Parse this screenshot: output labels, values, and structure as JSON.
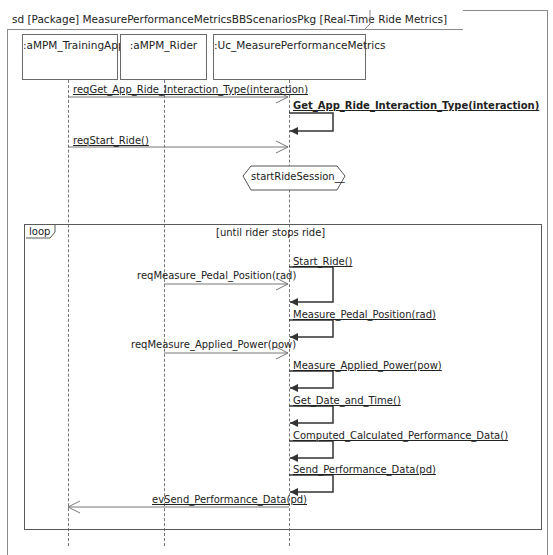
{
  "frame": {
    "title": "sd [Package] MeasurePerformanceMetricsBBScenariosPkg [Real-Time Ride Metrics]"
  },
  "lifelines": [
    {
      "label": ":aMPM_TrainingApp"
    },
    {
      "label": ":aMPM_Rider"
    },
    {
      "label": ":Uc_MeasurePerformanceMetrics"
    }
  ],
  "messages": [
    {
      "label": "reqGet_App_Ride_Interaction_Type(interaction)",
      "from": ":aMPM_TrainingApp",
      "to": ":Uc_MeasurePerformanceMetrics",
      "kind": "async"
    },
    {
      "label": "Get_App_Ride_Interaction_Type(interaction)",
      "from": ":Uc_MeasurePerformanceMetrics",
      "to": ":Uc_MeasurePerformanceMetrics",
      "kind": "self"
    },
    {
      "label": "reqStart_Ride()",
      "from": ":aMPM_TrainingApp",
      "to": ":Uc_MeasurePerformanceMetrics",
      "kind": "async"
    }
  ],
  "state": {
    "label": "startRideSession__"
  },
  "loop": {
    "operator": "loop",
    "guard": "[until rider stops ride]",
    "messages": [
      {
        "label": "Start_Ride()",
        "kind": "self"
      },
      {
        "label": "reqMeasure_Pedal_Position(rad)",
        "from": ":aMPM_Rider",
        "to": ":Uc_MeasurePerformanceMetrics",
        "kind": "async"
      },
      {
        "label": "Measure_Pedal_Position(rad)",
        "kind": "self"
      },
      {
        "label": "reqMeasure_Applied_Power(pow)",
        "from": ":aMPM_Rider",
        "to": ":Uc_MeasurePerformanceMetrics",
        "kind": "async"
      },
      {
        "label": "Measure_Applied_Power(pow)",
        "kind": "self"
      },
      {
        "label": "Get_Date_and_Time()",
        "kind": "self"
      },
      {
        "label": "Computed_Calculated_Performance_Data()",
        "kind": "self"
      },
      {
        "label": "Send_Performance_Data(pd)",
        "kind": "self"
      },
      {
        "label": "evSend_Performance_Data(pd)",
        "from": ":Uc_MeasurePerformanceMetrics",
        "to": ":aMPM_TrainingApp",
        "kind": "async"
      }
    ]
  }
}
